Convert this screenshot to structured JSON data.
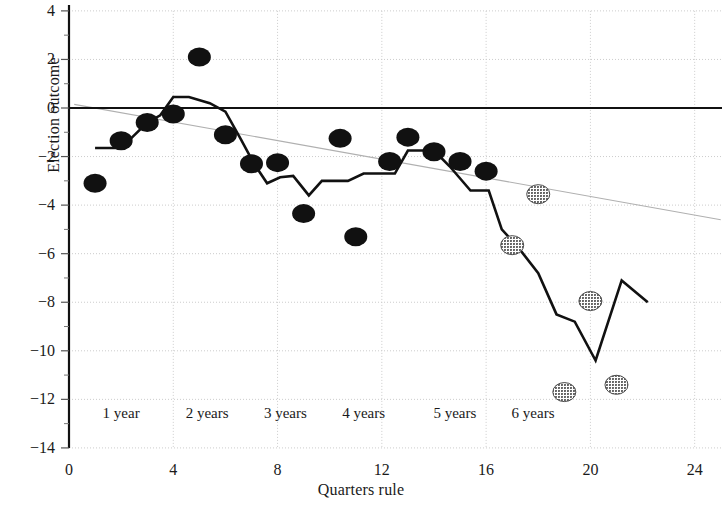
{
  "chart_data": {
    "type": "scatter",
    "title": "",
    "xlabel": "Quarters rule",
    "ylabel": "Election outcome",
    "xlim": [
      0,
      25
    ],
    "ylim": [
      -14,
      4
    ],
    "xticks": [
      0,
      4,
      8,
      12,
      16,
      20,
      24
    ],
    "xtick_labels": [
      "0",
      "4",
      "8",
      "12",
      "16",
      "20",
      "24"
    ],
    "yticks": [
      4,
      2,
      0,
      -2,
      -4,
      -6,
      -8,
      -10,
      -12,
      -14
    ],
    "ytick_labels": [
      "4",
      "2",
      "0",
      "−2",
      "−4",
      "−6",
      "−8",
      "−10",
      "−12",
      "−14"
    ],
    "grid": true,
    "legend": null,
    "zero_line": 0,
    "era_annotations": [
      {
        "label": "1 year",
        "x": 2.0
      },
      {
        "label": "2 years",
        "x": 5.3
      },
      {
        "label": "3 years",
        "x": 8.3
      },
      {
        "label": "4 years",
        "x": 11.3
      },
      {
        "label": "5 years",
        "x": 14.8
      },
      {
        "label": "6 years",
        "x": 17.8
      },
      {
        "label": "",
        "x": -99
      }
    ],
    "era_annotation_y": -12.6,
    "series": [
      {
        "name": "Election outcome (solid markers)",
        "type": "scatter",
        "marker": "filled-ellipse",
        "color": "#111111",
        "points": [
          {
            "x": 1,
            "y": -3.1
          },
          {
            "x": 2,
            "y": -1.35
          },
          {
            "x": 3,
            "y": -0.6
          },
          {
            "x": 4,
            "y": -0.25
          },
          {
            "x": 5,
            "y": 2.1
          },
          {
            "x": 6,
            "y": -1.1
          },
          {
            "x": 7,
            "y": -2.3
          },
          {
            "x": 8,
            "y": -2.25
          },
          {
            "x": 9,
            "y": -4.35
          },
          {
            "x": 11,
            "y": -5.3
          },
          {
            "x": 10.4,
            "y": -1.25
          },
          {
            "x": 12.3,
            "y": -2.2
          },
          {
            "x": 13,
            "y": -1.2
          },
          {
            "x": 14,
            "y": -1.8
          },
          {
            "x": 15,
            "y": -2.2
          },
          {
            "x": 16,
            "y": -2.6
          }
        ]
      },
      {
        "name": "Election outcome (shaded markers)",
        "type": "scatter",
        "marker": "hatched-ellipse",
        "color": "#6e6e6e",
        "points": [
          {
            "x": 17,
            "y": -5.65
          },
          {
            "x": 18,
            "y": -3.55
          },
          {
            "x": 19,
            "y": -11.7
          },
          {
            "x": 20,
            "y": -7.95
          },
          {
            "x": 21,
            "y": -11.4
          }
        ]
      },
      {
        "name": "Smoothed outcome",
        "type": "line",
        "style": "solid-thick",
        "color": "#111111",
        "points": [
          {
            "x": 1.0,
            "y": -1.65
          },
          {
            "x": 2.0,
            "y": -1.65
          },
          {
            "x": 3.0,
            "y": -0.6
          },
          {
            "x": 3.5,
            "y": -0.3
          },
          {
            "x": 4.0,
            "y": 0.45
          },
          {
            "x": 4.6,
            "y": 0.45
          },
          {
            "x": 5.4,
            "y": 0.2
          },
          {
            "x": 6.0,
            "y": -0.15
          },
          {
            "x": 6.6,
            "y": -1.3
          },
          {
            "x": 7.1,
            "y": -2.3
          },
          {
            "x": 7.6,
            "y": -3.1
          },
          {
            "x": 8.1,
            "y": -2.85
          },
          {
            "x": 8.6,
            "y": -2.8
          },
          {
            "x": 9.2,
            "y": -3.6
          },
          {
            "x": 9.7,
            "y": -3.0
          },
          {
            "x": 10.7,
            "y": -3.0
          },
          {
            "x": 11.3,
            "y": -2.7
          },
          {
            "x": 12.5,
            "y": -2.7
          },
          {
            "x": 13.0,
            "y": -1.75
          },
          {
            "x": 14.0,
            "y": -1.75
          },
          {
            "x": 14.6,
            "y": -2.4
          },
          {
            "x": 15.4,
            "y": -3.4
          },
          {
            "x": 16.1,
            "y": -3.4
          },
          {
            "x": 16.6,
            "y": -5.0
          },
          {
            "x": 17.2,
            "y": -5.7
          },
          {
            "x": 18.0,
            "y": -6.8
          },
          {
            "x": 18.7,
            "y": -8.5
          },
          {
            "x": 19.4,
            "y": -8.8
          },
          {
            "x": 20.2,
            "y": -10.4
          },
          {
            "x": 21.2,
            "y": -7.1
          },
          {
            "x": 22.2,
            "y": -8.0
          }
        ]
      },
      {
        "name": "Trend line",
        "type": "line",
        "style": "thin-gray",
        "color": "#b0b0b0",
        "points": [
          {
            "x": 0.2,
            "y": 0.15
          },
          {
            "x": 25.0,
            "y": -4.6
          }
        ]
      }
    ]
  },
  "axes": {
    "y_axis_name": "y-axis",
    "x_axis_name": "x-axis"
  }
}
